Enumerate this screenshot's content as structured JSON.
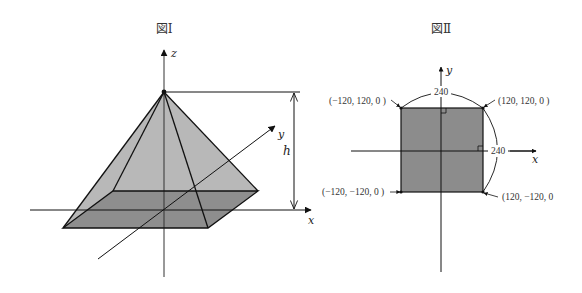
{
  "figure1": {
    "title": "図Ⅰ",
    "axes": {
      "x": "x",
      "y": "y",
      "z": "z"
    },
    "height_label": "h",
    "colors": {
      "face": "#b8b8b8",
      "base": "#8e8e8e",
      "edge": "#111111"
    }
  },
  "figure2": {
    "title": "図Ⅱ",
    "axes": {
      "x": "x",
      "y": "y"
    },
    "top_dimension": "240",
    "right_dimension": "240",
    "corners": {
      "top_left": "(−120, 120,  0 )",
      "top_right": "(120, 120,  0 )",
      "bottom_left": "(−120, −120,  0 )",
      "bottom_right": "(120, −120,  0"
    },
    "colors": {
      "square": "#8c8c8c",
      "edge": "#111111"
    }
  }
}
